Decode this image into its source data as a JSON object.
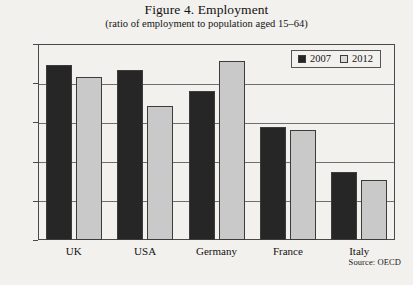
{
  "chart_data": {
    "type": "bar",
    "title": "Figure 4. Employment",
    "subtitle": "(ratio of employment to population aged 15–64)",
    "xlabel": "",
    "ylabel": "",
    "ylim": [
      50.0,
      75.0
    ],
    "ytick_labels": [
      "75.0",
      "70.0",
      "65.0",
      "60.0",
      "55.0",
      "50.0"
    ],
    "ytick_values": [
      75.0,
      70.0,
      65.0,
      60.0,
      55.0,
      50.0
    ],
    "grid": true,
    "legend_position": "top-right",
    "categories": [
      "UK",
      "USA",
      "Germany",
      "France",
      "Italy"
    ],
    "series": [
      {
        "name": "2007",
        "color": "#262626",
        "values": [
          72.3,
          71.7,
          69.0,
          64.4,
          58.7
        ]
      },
      {
        "name": "2012",
        "color": "#c9c9c9",
        "values": [
          70.8,
          67.1,
          72.8,
          64.0,
          57.6
        ]
      }
    ],
    "source_note": "Source: OECD"
  }
}
